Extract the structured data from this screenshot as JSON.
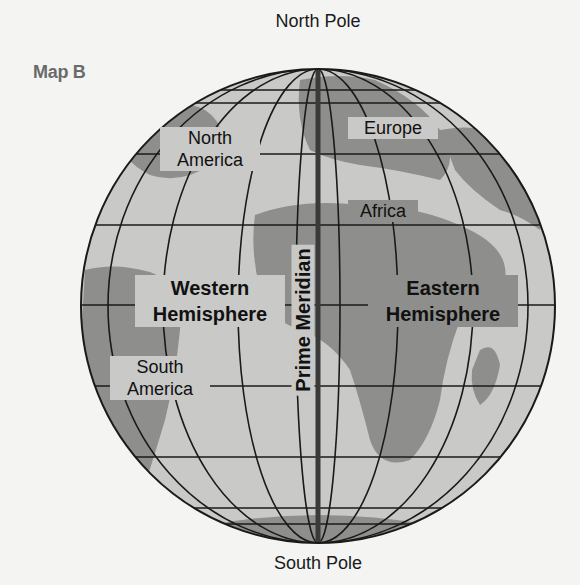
{
  "title": "Map B",
  "poles": {
    "north": "North Pole",
    "south": "South Pole"
  },
  "prime_meridian": "Prime Meridian",
  "hemispheres": {
    "western": {
      "line1": "Western",
      "line2": "Hemisphere"
    },
    "eastern": {
      "line1": "Eastern",
      "line2": "Hemisphere"
    }
  },
  "continents": {
    "north_america": {
      "line1": "North",
      "line2": "America"
    },
    "south_america": {
      "line1": "South",
      "line2": "America"
    },
    "europe": "Europe",
    "africa": "Africa"
  },
  "colors": {
    "ocean": "#c9c9c7",
    "land": "#8e8e8c",
    "grid": "#1a1a1a",
    "meridian": "#3a3a3a",
    "background": "#f4f4f2"
  }
}
